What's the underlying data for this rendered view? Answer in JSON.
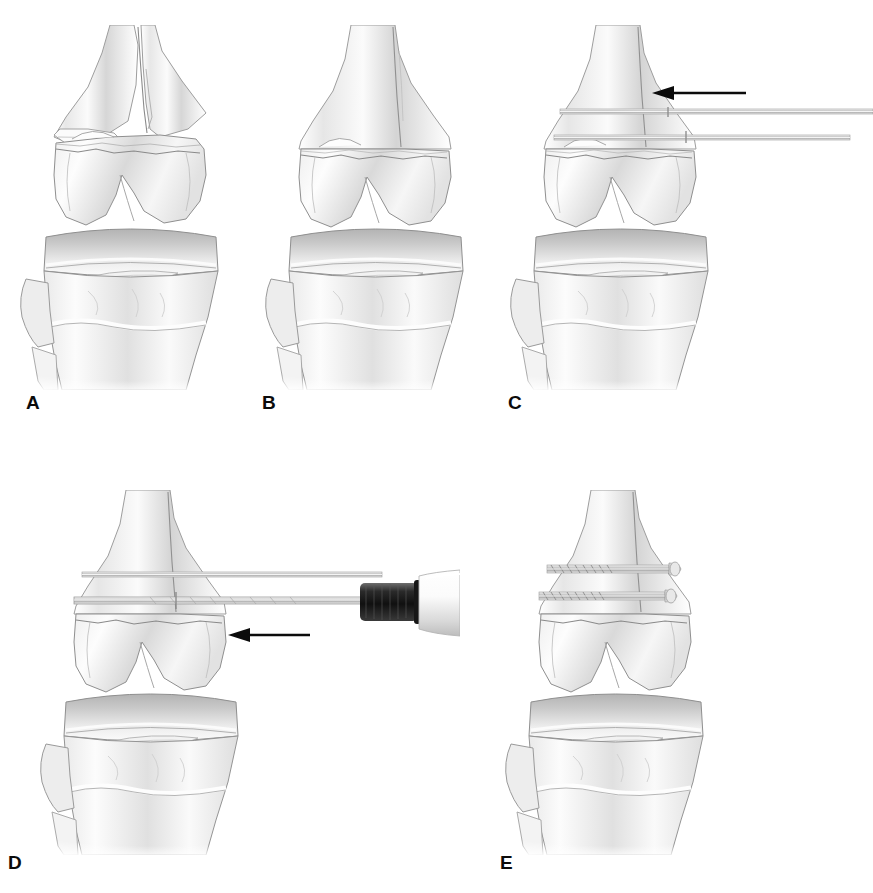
{
  "figure": {
    "kind": "medical-illustration",
    "view": "anteroposterior",
    "style": "grayscale pencil / airbrush line drawing",
    "background_color": "#ffffff",
    "ink_color": "#0b0b0b",
    "bone_light": "#f4f4f4",
    "bone_mid": "#dcdcdc",
    "bone_shadow": "#b9b9b9",
    "bone_dark": "#9a9a9a",
    "outline_color": "#8d8d8d",
    "metal_color": "#cfcfcf",
    "metal_dark": "#1d1d1d",
    "panel_count": 5,
    "rows": 2
  },
  "panels": [
    {
      "id": "A",
      "label": "A",
      "label_x": 26,
      "label_y": 393,
      "caption": "Displaced distal femoral fracture with separated condylar fragments",
      "stage": "injury",
      "has_arrow": false,
      "arrow_direction": null,
      "instruments": [],
      "implants": [],
      "x": 10,
      "y": 25,
      "width": 240,
      "height": 360
    },
    {
      "id": "B",
      "label": "B",
      "label_x": 262,
      "label_y": 393,
      "caption": "Anatomic reduction of the fracture fragments",
      "stage": "reduction",
      "has_arrow": false,
      "arrow_direction": null,
      "instruments": [],
      "implants": [],
      "x": 255,
      "y": 25,
      "width": 240,
      "height": 360
    },
    {
      "id": "C",
      "label": "C",
      "label_x": 508,
      "label_y": 393,
      "caption": "Two parallel guide wires inserted across the reduced fracture",
      "stage": "guide-wire-insertion",
      "has_arrow": true,
      "arrow_direction": "left",
      "instruments": [
        "guide-wire",
        "guide-wire"
      ],
      "implants": [],
      "x": 500,
      "y": 25,
      "width": 373,
      "height": 360
    },
    {
      "id": "D",
      "label": "D",
      "label_x": 8,
      "label_y": 853,
      "caption": "Cannulated drill advanced over the guide wire",
      "stage": "cannulated-drilling",
      "has_arrow": true,
      "arrow_direction": "left",
      "instruments": [
        "cannulated-drill",
        "drill-chuck",
        "drill-handle",
        "guide-wire"
      ],
      "implants": [],
      "x": 30,
      "y": 490,
      "width": 430,
      "height": 360
    },
    {
      "id": "E",
      "label": "E",
      "label_x": 500,
      "label_y": 853,
      "caption": "Two cannulated lag screws in final position",
      "stage": "final-fixation",
      "has_arrow": false,
      "arrow_direction": null,
      "instruments": [],
      "implants": [
        "cannulated-screw",
        "cannulated-screw"
      ],
      "x": 495,
      "y": 490,
      "width": 300,
      "height": 360
    }
  ]
}
